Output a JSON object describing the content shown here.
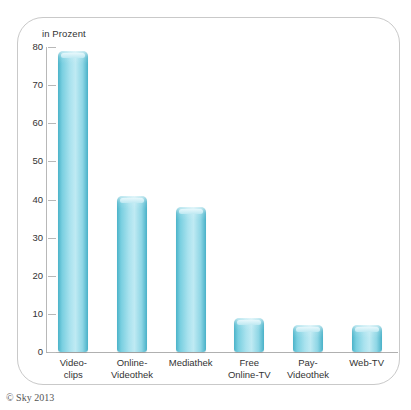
{
  "chart_data": {
    "type": "bar",
    "title": "",
    "subtitle": "",
    "xlabel": "",
    "ylabel": "in Prozent",
    "axis_caption": "in Prozent",
    "categories": [
      "Video-\nclips",
      "Online-\nVideothek",
      "Mediathek",
      "Free\nOnline-TV",
      "Pay-\nVideothek",
      "Web-TV"
    ],
    "values": [
      79,
      41,
      38,
      9,
      7,
      7
    ],
    "ylim": [
      0,
      80
    ],
    "yticks": [
      0,
      10,
      20,
      30,
      40,
      50,
      60,
      70,
      80
    ],
    "ytick_labels": [
      "0",
      "10",
      "20",
      "30",
      "40",
      "50",
      "60",
      "70",
      "80"
    ],
    "grid": false,
    "legend": null,
    "series": [
      {
        "name": "in Prozent",
        "values": [
          79,
          41,
          38,
          9,
          7,
          7
        ]
      }
    ],
    "bar_color": "#8ed6e5",
    "bar_edge_color": "#49b1c8"
  },
  "source": {
    "credit": "© Sky 2013"
  }
}
